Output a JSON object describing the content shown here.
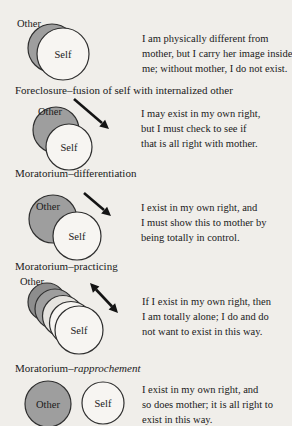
{
  "figure": {
    "sections": [
      {
        "name": "foreclosure",
        "diagram": {
          "other_label": "Other",
          "self_label": "Self"
        },
        "caption_lines": [
          "I am physically different from",
          "mother, but I carry her image inside",
          "me; without mother, I do not exist."
        ],
        "heading": "Foreclosure–fusion of self with internalized other"
      },
      {
        "name": "moratorium-differentiation",
        "diagram": {
          "other_label": "Other",
          "self_label": "Self"
        },
        "caption_lines": [
          "I may exist in my own right,",
          "but I must check to see if",
          "that is all right with mother."
        ],
        "heading": "Moratorium–differentiation"
      },
      {
        "name": "moratorium-practicing",
        "diagram": {
          "other_label": "Other",
          "self_label": "Self"
        },
        "caption_lines": [
          "I exist in my own right, and",
          "I must show this to mother by",
          "being totally in control."
        ],
        "heading": "Moratorium–practicing"
      },
      {
        "name": "moratorium-rapprochement",
        "diagram": {
          "other_label": "Other",
          "self_label": "Self"
        },
        "caption_lines": [
          "If I exist in my own right, then",
          "I am totally alone; I do and do",
          "not want to exist in this way."
        ],
        "heading_prefix": "Moratorium–",
        "heading_italic": "rapprochement"
      },
      {
        "name": "resolution",
        "diagram": {
          "other_label": "Other",
          "self_label": "Self"
        },
        "caption_lines": [
          "I exist in my own right, and",
          "so does mother; it is all right to",
          "exist in this way."
        ]
      }
    ]
  },
  "colors": {
    "background": "#f0eeea",
    "circle_shaded": "#9e9e9e",
    "circle_shaded_dark": "#8d8d8d",
    "circle_light": "#f7f5f2",
    "circle_light_dim": "#e6e4e0",
    "outline": "#2f2f2f",
    "arrow": "#141414",
    "text": "#1a1a1a"
  }
}
